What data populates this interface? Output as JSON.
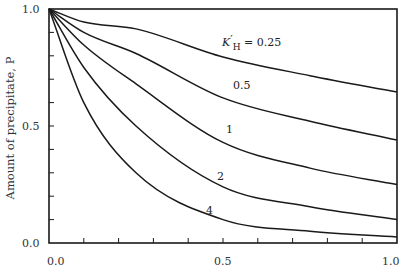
{
  "chart_data": {
    "type": "line",
    "title": "",
    "xlabel": "",
    "ylabel": "Amount of precipitate, P",
    "xlim": [
      0.0,
      1.0
    ],
    "ylim": [
      0.0,
      1.0
    ],
    "x_ticks": [
      "0.0",
      "0.5",
      "1.0"
    ],
    "y_ticks": [
      "0.0",
      "0.5",
      "1.0"
    ],
    "x_minor_step": 0.1,
    "y_minor_step": 0.1,
    "grid": false,
    "legend": "inline curve labels",
    "label_prefix": "K'H =",
    "x": [
      0.0,
      0.1,
      0.25,
      0.5,
      0.75,
      1.0
    ],
    "series": [
      {
        "name": "0.25",
        "label": "K'H = 0.25",
        "values": [
          1.0,
          0.944,
          0.915,
          0.795,
          0.715,
          0.645
        ]
      },
      {
        "name": "0.5",
        "label": "0.5",
        "values": [
          1.0,
          0.9,
          0.81,
          0.62,
          0.52,
          0.44
        ]
      },
      {
        "name": "1",
        "label": "1",
        "values": [
          1.0,
          0.846,
          0.68,
          0.43,
          0.32,
          0.25
        ]
      },
      {
        "name": "2",
        "label": "2",
        "values": [
          1.0,
          0.75,
          0.5,
          0.24,
          0.155,
          0.1
        ]
      },
      {
        "name": "4",
        "label": "4",
        "values": [
          1.0,
          0.6,
          0.3,
          0.1,
          0.05,
          0.026
        ]
      }
    ],
    "curve_label_positions": [
      {
        "x": 0.498,
        "y": 0.84
      },
      {
        "x": 0.53,
        "y": 0.637
      },
      {
        "x": 0.515,
        "y": 0.453
      },
      {
        "x": 0.49,
        "y": 0.25
      },
      {
        "x": 0.458,
        "y": 0.1
      }
    ]
  },
  "axes": {
    "y_title": "Amount of precipitate, P",
    "x_tick_labels": [
      "0.0",
      "0.5",
      "1.0"
    ],
    "y_tick_labels": [
      "0.0",
      "0.5",
      "1.0"
    ]
  },
  "labels": {
    "k_symbol": "K",
    "k_prime": "′",
    "k_sub": "H",
    "k_eq": " = 0.25",
    "c05": "0.5",
    "c1": "1",
    "c2": "2",
    "c4": "4"
  },
  "style": {
    "line_color": "#1a1a1a",
    "background": "#ffffff"
  }
}
